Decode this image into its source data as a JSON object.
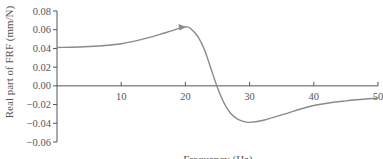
{
  "chart_data": {
    "type": "line",
    "title": "",
    "xlabel": "Frequency (Hz)",
    "ylabel": "Real part of FRF (mm/N)",
    "xlim": [
      0,
      50
    ],
    "ylim": [
      -0.06,
      0.08
    ],
    "xticks": [
      10,
      20,
      30,
      40,
      50
    ],
    "xtick_labels": [
      "10",
      "20",
      "30",
      "40",
      "50"
    ],
    "yticks": [
      0.08,
      0.06,
      0.04,
      0.02,
      0.0,
      -0.02,
      -0.04,
      -0.06
    ],
    "ytick_labels": [
      "0.08",
      "0.06",
      "0.04",
      "0.02",
      "0.00",
      "−0.02",
      "−0.04",
      "−0.06"
    ],
    "grid": false,
    "legend": null,
    "annotations": [
      {
        "type": "arrowhead",
        "x": 20,
        "y": 0.063,
        "note": "arrowhead on curve near peak"
      }
    ],
    "series": [
      {
        "name": "Real part of FRF",
        "color": "#8a8a8a",
        "x": [
          0,
          5,
          10,
          14,
          17,
          20,
          21,
          22,
          23,
          24,
          25,
          26,
          27,
          28,
          29,
          30,
          32,
          35,
          40,
          45,
          50
        ],
        "y": [
          0.041,
          0.042,
          0.045,
          0.051,
          0.057,
          0.063,
          0.06,
          0.052,
          0.038,
          0.018,
          -0.002,
          -0.018,
          -0.029,
          -0.035,
          -0.038,
          -0.039,
          -0.037,
          -0.031,
          -0.021,
          -0.016,
          -0.013
        ]
      }
    ]
  },
  "colors": {
    "axis": "#555555",
    "curve": "#8a8a8a",
    "background": "#ffffff"
  }
}
